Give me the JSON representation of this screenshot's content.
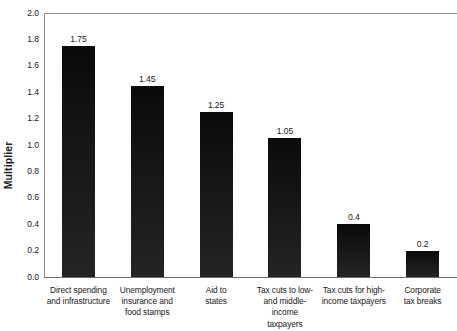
{
  "chart_data": {
    "type": "bar",
    "title": "",
    "subtitle": "",
    "xlabel": "",
    "ylabel": "Multiplier",
    "ylim": [
      0.0,
      2.0
    ],
    "ytick_step": 0.2,
    "grid": false,
    "legend": "none",
    "bar_color": "#141414",
    "axis_color": "#8f8f8f",
    "text_color": "#1a1a1a",
    "categories": [
      "Direct spending and infrastructure",
      "Unemployment insurance and food stamps",
      "Aid to states",
      "Tax cuts to low- and middle-income taxpayers",
      "Tax cuts for high-income taxpayers",
      "Corporate tax breaks"
    ],
    "category_lines": [
      [
        "Direct spending",
        "and infrastructure"
      ],
      [
        "Unemployment",
        "insurance and",
        "food stamps"
      ],
      [
        "Aid to",
        "states"
      ],
      [
        "Tax cuts to low-",
        "and middle-income",
        "taxpayers"
      ],
      [
        "Tax cuts for high-",
        "income taxpayers"
      ],
      [
        "Corporate",
        "tax breaks"
      ]
    ],
    "values": [
      1.75,
      1.45,
      1.25,
      1.05,
      0.4,
      0.2
    ],
    "value_labels": [
      "1.75",
      "1.45",
      "1.25",
      "1.05",
      "0.4",
      "0.2"
    ],
    "ytick_labels": [
      "2.0",
      "1.8",
      "1.6",
      "1.4",
      "1.2",
      "1.0",
      "0.8",
      "0.6",
      "0.4",
      "0.2",
      "0.0"
    ],
    "ytick_values": [
      2.0,
      1.8,
      1.6,
      1.4,
      1.2,
      1.0,
      0.8,
      0.6,
      0.4,
      0.2,
      0.0
    ]
  }
}
